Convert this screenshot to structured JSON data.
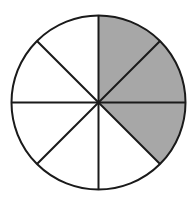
{
  "figure": {
    "name": "fraction-circle-diagram",
    "shape": "circle",
    "total_sectors": 8,
    "shaded_sectors": 3,
    "unshaded_sectors": 5,
    "fraction_label": "3/8",
    "sector_angle_degrees": 45,
    "background_color": "#ffffff",
    "shaded_color": "#a7a7a7",
    "unshaded_color": "#ffffff",
    "stroke_color": "#1a1a1a",
    "stroke_width": 2,
    "geometry": {
      "center_x": 98.5,
      "center_y": 102.5,
      "radius": 87
    },
    "sectors": [
      {
        "index": 1,
        "start_deg": 0,
        "end_deg": 45,
        "clock_span": "12:00-1:30",
        "shaded": true
      },
      {
        "index": 2,
        "start_deg": 45,
        "end_deg": 90,
        "clock_span": "1:30-3:00",
        "shaded": true
      },
      {
        "index": 3,
        "start_deg": 90,
        "end_deg": 135,
        "clock_span": "3:00-4:30",
        "shaded": true
      },
      {
        "index": 4,
        "start_deg": 135,
        "end_deg": 180,
        "clock_span": "4:30-6:00",
        "shaded": false
      },
      {
        "index": 5,
        "start_deg": 180,
        "end_deg": 225,
        "clock_span": "6:00-7:30",
        "shaded": false
      },
      {
        "index": 6,
        "start_deg": 225,
        "end_deg": 270,
        "clock_span": "7:30-9:00",
        "shaded": false
      },
      {
        "index": 7,
        "start_deg": 270,
        "end_deg": 315,
        "clock_span": "9:00-10:30",
        "shaded": false
      },
      {
        "index": 8,
        "start_deg": 315,
        "end_deg": 360,
        "clock_span": "10:30-12:00",
        "shaded": false
      }
    ],
    "diameters": [
      {
        "name": "vertical-diameter",
        "from": "12:00",
        "to": "6:00"
      },
      {
        "name": "horizontal-diameter",
        "from": "3:00",
        "to": "9:00"
      },
      {
        "name": "diagonal-diameter-ne-sw",
        "from": "1:30",
        "to": "7:30"
      },
      {
        "name": "diagonal-diameter-se-nw",
        "from": "4:30",
        "to": "10:30"
      }
    ]
  }
}
